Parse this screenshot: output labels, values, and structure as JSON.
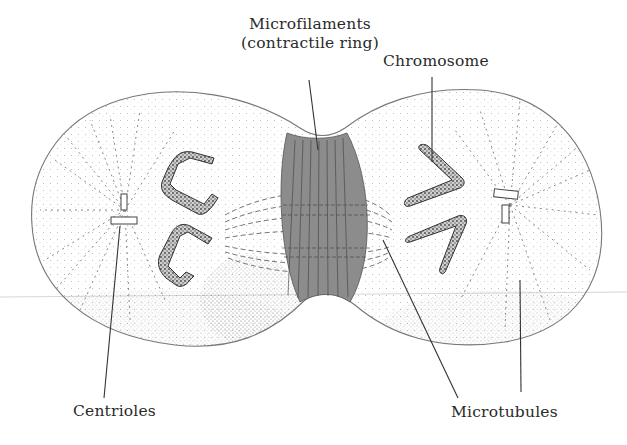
{
  "figure": {
    "background": "#ffffff",
    "ring_fill": "#8c8c8c",
    "line_color": "#555555",
    "text_color": "#2a2a2a"
  },
  "labels": {
    "microfilaments_line1": "Microfilaments",
    "microfilaments_line2": "(contractile ring)",
    "chromosome": "Chromosome",
    "centrioles": "Centrioles",
    "microtubules": "Microtubules"
  }
}
